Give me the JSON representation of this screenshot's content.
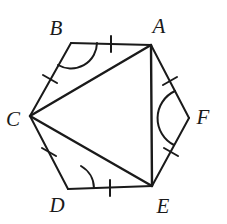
{
  "figure": {
    "kind": "geometry-diagram",
    "stroke_color": "#1a1a1a",
    "background_color": "#ffffff",
    "stroke_width": 2,
    "canvas": {
      "width": 227,
      "height": 224
    }
  },
  "vertices": [
    {
      "id": "A",
      "label": "A",
      "x": 151,
      "y": 45,
      "label_x": 159,
      "label_y": 26
    },
    {
      "id": "B",
      "label": "B",
      "x": 71,
      "y": 43,
      "label_x": 56,
      "label_y": 28
    },
    {
      "id": "C",
      "label": "C",
      "x": 30,
      "y": 116,
      "label_x": 13,
      "label_y": 119
    },
    {
      "id": "D",
      "label": "D",
      "x": 68,
      "y": 189,
      "label_x": 57,
      "label_y": 205
    },
    {
      "id": "E",
      "label": "E",
      "x": 152,
      "y": 186,
      "label_x": 163,
      "label_y": 206
    },
    {
      "id": "F",
      "label": "F",
      "x": 189,
      "y": 118,
      "label_x": 203,
      "label_y": 117
    }
  ],
  "sides": [
    {
      "id": "BA",
      "from": "B",
      "to": "A",
      "ticks": 1
    },
    {
      "id": "CB",
      "from": "C",
      "to": "B",
      "ticks": 1
    },
    {
      "id": "CD",
      "from": "C",
      "to": "D",
      "ticks": 1
    },
    {
      "id": "DE",
      "from": "D",
      "to": "E",
      "ticks": 1
    },
    {
      "id": "AF",
      "from": "A",
      "to": "F",
      "ticks": 1
    },
    {
      "id": "FE",
      "from": "F",
      "to": "E",
      "ticks": 1
    }
  ],
  "diagonals": [
    {
      "id": "CA",
      "from": "C",
      "to": "A"
    },
    {
      "id": "CE",
      "from": "C",
      "to": "E"
    },
    {
      "id": "AE",
      "from": "A",
      "to": "E"
    }
  ],
  "angle_arcs": [
    {
      "id": "angle-B",
      "vertex": "B",
      "radius": 26
    },
    {
      "id": "angle-D",
      "vertex": "D",
      "radius": 26
    },
    {
      "id": "angle-F",
      "vertex": "F",
      "radius": 28
    }
  ],
  "tick_marks": [
    {
      "id": "tick-BA",
      "side": "BA",
      "x": 111,
      "y": 44
    },
    {
      "id": "tick-CB",
      "side": "CB",
      "x": 50,
      "y": 79
    },
    {
      "id": "tick-CD",
      "side": "CD",
      "x": 49,
      "y": 152
    },
    {
      "id": "tick-DE",
      "side": "DE",
      "x": 110,
      "y": 188
    },
    {
      "id": "tick-AF",
      "side": "AF",
      "x": 170,
      "y": 81
    },
    {
      "id": "tick-FE",
      "side": "FE",
      "x": 171,
      "y": 152
    }
  ]
}
